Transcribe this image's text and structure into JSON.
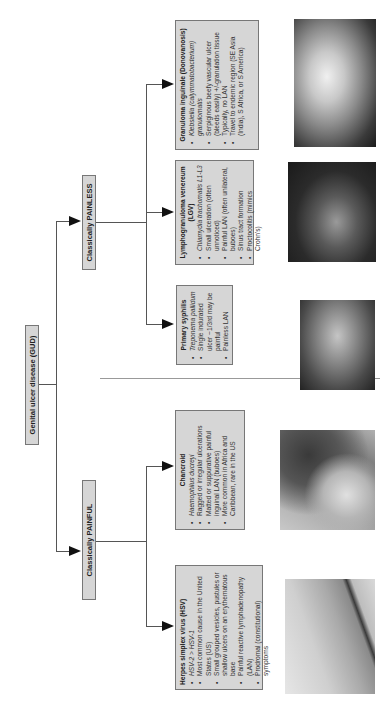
{
  "diagram": {
    "orientation": "rotated 90 degrees counter-clockwise",
    "root": {
      "label": "Genital ulcer disease (GUD)"
    },
    "branches": [
      {
        "label": "Classically PAINFUL"
      },
      {
        "label": "Classically PAINLESS"
      }
    ],
    "diseases": {
      "hsv": {
        "title": "Herpes simplex virus (HSV)",
        "bullets": [
          "HSV-2 > HSV-1",
          "Most common cause in the United States (US)",
          "Small grouped vesicles, pustules or shallow ulcers on an erythematous base",
          "Painful reactive lymphadenopathy (LAN)",
          "Prodromal (constitutional) symptoms"
        ]
      },
      "chancroid": {
        "title": "Chancroid",
        "bullets": [
          "Haemophilus ducreyi",
          "Ragged or irregular ulcerations",
          "Matted or suppurative painful inguinal LAN (buboes)",
          "More common in Africa and Caribbean, rare in the US"
        ]
      },
      "syphilis": {
        "title": "Primary syphilis",
        "bullets": [
          "Treponema pallidum",
          "Single indurated ulcer ~1/3rd may be painful",
          "Painless LAN"
        ]
      },
      "lgv": {
        "title": "Lymphogranuloma venereum (LGV)",
        "bullets": [
          "Chlamydia trachomatis L1-L3",
          "Small ulceration (often unnoticed)",
          "Painful LAN (often unilateral, buboes)",
          "Sinus tract formation",
          "Proctocolitis (mimics Crohn's)"
        ]
      },
      "granuloma": {
        "title": "Granuloma inguinale (Donovanosis)",
        "bullets": [
          "Klebsiella (calymmatobacterium) granulomatis",
          "Serpiginous beefy vascular ulcer (bleeds easily) +/-granulation tissue",
          "Typically, no LAN",
          "Travel to endemic region (SE Asia (India), S Africa, or S America)"
        ]
      }
    },
    "photos": [
      {
        "name": "hsv-clinical-photo",
        "tone": "light"
      },
      {
        "name": "chancroid-clinical-photo",
        "tone": "medium"
      },
      {
        "name": "syphilis-clinical-photo",
        "tone": "medium-dark"
      },
      {
        "name": "lgv-clinical-photo",
        "tone": "dark"
      },
      {
        "name": "granuloma-clinical-photo",
        "tone": "dark"
      }
    ],
    "colors": {
      "box_fill": "#d6d6d6",
      "box_border": "#777777",
      "lines": "#555555",
      "arrow": "#111111"
    }
  }
}
